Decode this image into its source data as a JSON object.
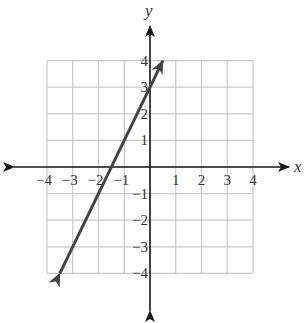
{
  "chart_data": {
    "type": "line",
    "title": "",
    "xlabel": "x",
    "ylabel": "y",
    "xlim": [
      -4,
      4
    ],
    "ylim": [
      -4,
      4
    ],
    "grid": true,
    "x_ticks": [
      "-4",
      "-3",
      "-2",
      "-1",
      "1",
      "2",
      "3",
      "4"
    ],
    "y_ticks": [
      "4",
      "3",
      "2",
      "1",
      "-1",
      "-2",
      "-3",
      "-4"
    ],
    "series": [
      {
        "name": "line",
        "equation": "y = 2x + 3",
        "slope": 2,
        "intercept": 3,
        "x": [
          -3.5,
          0.5
        ],
        "y": [
          -4,
          4
        ],
        "arrows": "both"
      }
    ],
    "colors": {
      "grid": "#c8c8c8",
      "axis": "#1a1a1a",
      "line": "#444444"
    }
  },
  "labels": {
    "x_axis": "x",
    "y_axis": "y",
    "x_ticks": [
      {
        "v": -4,
        "t": "−4"
      },
      {
        "v": -3,
        "t": "−3"
      },
      {
        "v": -2,
        "t": "−2"
      },
      {
        "v": -1,
        "t": "−1"
      },
      {
        "v": 1,
        "t": "1"
      },
      {
        "v": 2,
        "t": "2"
      },
      {
        "v": 3,
        "t": "3"
      },
      {
        "v": 4,
        "t": "4"
      }
    ],
    "y_ticks": [
      {
        "v": 4,
        "t": "4"
      },
      {
        "v": 3,
        "t": "3"
      },
      {
        "v": 2,
        "t": "2"
      },
      {
        "v": 1,
        "t": "1"
      },
      {
        "v": -1,
        "t": "−1"
      },
      {
        "v": -2,
        "t": "−2"
      },
      {
        "v": -3,
        "t": "−3"
      },
      {
        "v": -4,
        "t": "−4"
      }
    ]
  }
}
